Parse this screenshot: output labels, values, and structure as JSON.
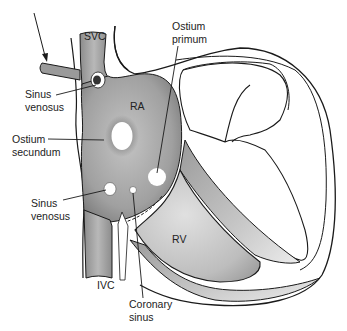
{
  "diagram": {
    "labels": {
      "svc": "SVC",
      "ivc": "IVC",
      "ra": "RA",
      "rv": "RV",
      "sinus_venosus_upper_1": "Sinus",
      "sinus_venosus_upper_2": "venosus",
      "ostium_secundum_1": "Ostium",
      "ostium_secundum_2": "secundum",
      "sinus_venosus_lower_1": "Sinus",
      "sinus_venosus_lower_2": "venosus",
      "ostium_primum_1": "Ostium",
      "ostium_primum_2": "primum",
      "coronary_sinus_1": "Coronary",
      "coronary_sinus_2": "sinus"
    },
    "colors": {
      "outline": "#1a1a1a",
      "chamber_dark": "#8a8a8a",
      "chamber_mid": "#b0b0b0",
      "chamber_light": "#d8d8d8",
      "background": "#ffffff"
    }
  }
}
